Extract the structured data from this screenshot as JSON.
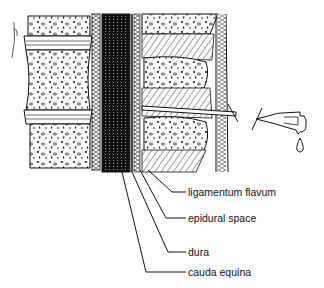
{
  "figure": {
    "colors": {
      "ink": "#111111",
      "paper": "#ffffff"
    }
  },
  "labels": [
    {
      "id": "ligamentum-flavum",
      "text": "ligamentum flavum",
      "x": 188,
      "y": 187
    },
    {
      "id": "epidural-space",
      "text": "epidural space",
      "x": 188,
      "y": 214
    },
    {
      "id": "dura",
      "text": "dura",
      "x": 188,
      "y": 247
    },
    {
      "id": "cauda-equina",
      "text": "cauda equina",
      "x": 188,
      "y": 266
    }
  ]
}
